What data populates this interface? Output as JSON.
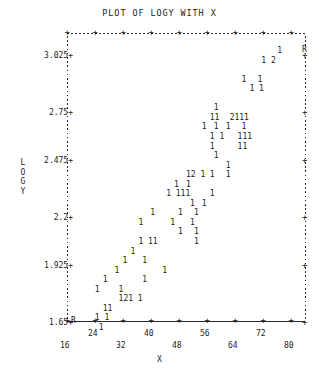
{
  "chart_data": {
    "type": "scatter",
    "title": "PLOT OF LOGY WITH X",
    "xlabel": "X",
    "ylabel": "LOGY",
    "ylabel_chars": [
      "L",
      "O",
      "G",
      "Y"
    ],
    "plot_style": "ascii-character-plot",
    "point_symbol": "1",
    "overlap_symbols": {
      "2": "two points in same cell"
    },
    "out_of_range_symbol": "R",
    "grid": "dotted-border",
    "legend": null,
    "xlim": [
      16,
      84
    ],
    "ylim": [
      1.5,
      3.2
    ],
    "yticks": [
      "3.025",
      "2.75",
      "2.475",
      "2.2",
      "1.925",
      "1.65"
    ],
    "ytick_values": [
      3.025,
      2.75,
      2.475,
      2.2,
      1.925,
      1.65
    ],
    "xticks_upper": [
      "24",
      "40",
      "56",
      "72"
    ],
    "xticks_lower": [
      "16",
      "32",
      "48",
      "64",
      "80"
    ],
    "xtick_values": [
      16,
      24,
      32,
      40,
      48,
      56,
      64,
      72,
      80
    ],
    "tick_glyph": "+",
    "axis_r_markers": {
      "top_right": "R",
      "bottom_left": "R"
    },
    "rows": [
      {
        "y": 0,
        "cells": [
          {
            "col": 53,
            "text": "1"
          }
        ]
      },
      {
        "y": 1,
        "cells": [
          {
            "col": 49,
            "text": "1 2"
          }
        ]
      },
      {
        "y": 2,
        "cells": []
      },
      {
        "y": 3,
        "cells": [
          {
            "col": 44,
            "text": "1"
          },
          {
            "col": 48,
            "text": "1"
          }
        ]
      },
      {
        "y": 4,
        "cells": [
          {
            "col": 46,
            "text": "1 1"
          }
        ]
      },
      {
        "y": 5,
        "cells": []
      },
      {
        "y": 6,
        "cells": [
          {
            "col": 37,
            "text": "1"
          }
        ]
      },
      {
        "y": 7,
        "cells": [
          {
            "col": 36,
            "text": "11"
          },
          {
            "col": 41,
            "text": "2111"
          }
        ]
      },
      {
        "y": 8,
        "cells": [
          {
            "col": 34,
            "text": "1"
          },
          {
            "col": 37,
            "text": "1"
          },
          {
            "col": 40,
            "text": "1"
          },
          {
            "col": 44,
            "text": "1"
          }
        ]
      },
      {
        "y": 9,
        "cells": [
          {
            "col": 36,
            "text": "1 1"
          },
          {
            "col": 43,
            "text": "111"
          }
        ]
      },
      {
        "y": 10,
        "cells": [
          {
            "col": 36,
            "text": "1"
          },
          {
            "col": 43,
            "text": "11"
          }
        ]
      },
      {
        "y": 11,
        "cells": [
          {
            "col": 37,
            "text": "1"
          }
        ]
      },
      {
        "y": 12,
        "cells": [
          {
            "col": 40,
            "text": "1"
          }
        ]
      },
      {
        "y": 13,
        "cells": [
          {
            "col": 30,
            "text": "12 1"
          },
          {
            "col": 36,
            "text": "1"
          },
          {
            "col": 40,
            "text": "1"
          }
        ]
      },
      {
        "y": 14,
        "cells": [
          {
            "col": 27,
            "text": "1"
          },
          {
            "col": 30,
            "text": "1"
          }
        ]
      },
      {
        "y": 15,
        "cells": [
          {
            "col": 25,
            "text": "1 111"
          },
          {
            "col": 36,
            "text": "1"
          }
        ]
      },
      {
        "y": 16,
        "cells": [
          {
            "col": 31,
            "text": "1"
          },
          {
            "col": 34,
            "text": "1"
          }
        ]
      },
      {
        "y": 17,
        "cells": [
          {
            "col": 21,
            "text": "1"
          },
          {
            "col": 28,
            "text": "1"
          },
          {
            "col": 32,
            "text": "1"
          }
        ]
      },
      {
        "y": 18,
        "cells": [
          {
            "col": 18,
            "text": "1"
          },
          {
            "col": 26,
            "text": "1"
          },
          {
            "col": 31,
            "text": "1"
          }
        ]
      },
      {
        "y": 19,
        "cells": [
          {
            "col": 28,
            "text": "1"
          },
          {
            "col": 32,
            "text": "1"
          }
        ]
      },
      {
        "y": 20,
        "cells": [
          {
            "col": 18,
            "text": "1 11"
          },
          {
            "col": 32,
            "text": "1"
          }
        ]
      },
      {
        "y": 21,
        "cells": [
          {
            "col": 16,
            "text": "1"
          }
        ]
      },
      {
        "y": 22,
        "cells": [
          {
            "col": 14,
            "text": "1"
          },
          {
            "col": 19,
            "text": "1"
          }
        ]
      },
      {
        "y": 23,
        "cells": [
          {
            "col": 12,
            "text": "1"
          },
          {
            "col": 24,
            "text": "1"
          }
        ]
      },
      {
        "y": 24,
        "cells": [
          {
            "col": 9,
            "text": "1"
          },
          {
            "col": 19,
            "text": "1"
          }
        ]
      },
      {
        "y": 25,
        "cells": [
          {
            "col": 7,
            "text": "1"
          },
          {
            "col": 13,
            "text": "1"
          }
        ]
      },
      {
        "y": 26,
        "cells": [
          {
            "col": 13,
            "text": "121 1"
          }
        ]
      },
      {
        "y": 27,
        "cells": [
          {
            "col": 9,
            "text": "11"
          }
        ]
      },
      {
        "y": 28,
        "cells": [
          {
            "col": 7,
            "text": "1 1"
          }
        ]
      },
      {
        "y": 29,
        "cells": [
          {
            "col": 8,
            "text": "1"
          }
        ]
      }
    ]
  }
}
